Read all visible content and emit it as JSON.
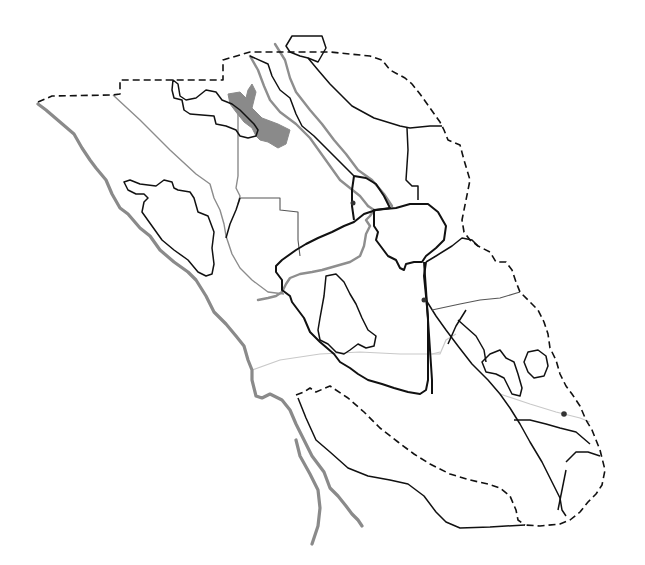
{
  "map": {
    "width": 645,
    "height": 565,
    "background": "#ffffff",
    "labels": [],
    "colors": {
      "coast": "#8a8a8a",
      "river": "#8e8e8e",
      "lake": "#8a8a8a",
      "boundary": "#111111",
      "boundary_secondary": "#555555",
      "road": "#c9c9c9",
      "point": "#333333"
    },
    "layers": {
      "outer_dashed_boundary": "M38,102 L52,96 L113,95 L120,94 L120,80 L223,80 L223,60 L250,52 L330,52 L370,56 L382,60 L390,70 L405,78 L412,84 L420,94 L430,108 L440,122 L444,130 L448,140 L460,145 L464,160 L470,180 L466,200 L462,220 L464,232 L470,240 L478,246 L490,252 L496,262 L506,262 L512,270 L516,282 L520,292 L528,300 L538,310 L544,322 L548,334 L550,348 L556,360 L560,374 L566,386 L572,394 L580,406 L586,420 L592,430 L600,450 L605,470 L602,485 L596,494 L588,502 L580,512 L570,520 L560,524 L540,526 L525,525",
      "coastline": "M38,104 L46,110 L60,122 L74,134 L82,148 L90,160 L96,168 L106,180 L112,194 L120,208 L128,214 L140,228 L150,236 L160,250 L174,262 L188,272 L196,280 L206,296 L214,312 L226,324 L236,336 L244,346 L248,360 L252,370 L252,380 L256,396 L262,398 L270,394 L282,400 L290,410 L296,424 L304,440 L312,456 L324,472 L330,488 L338,496 L346,506 L352,514 L358,520 L362,526",
      "estuary_inner_coast": "M296,440 L300,456 L310,474 L318,490 L320,508 L318,526 L312,544",
      "west_dashed_strip": "M296,395 L304,392 L310,388 L316,392 L330,386 L348,398 L364,412 L380,428 L398,442 L414,454 L430,464 L450,474 L470,480 L488,484 L500,488 L510,496 L516,510 L518,520 L525,525",
      "south_black_curve": "M298,398 L306,418 L316,440 L330,452 L348,468 L368,476 L390,480 L408,484 L424,496 L436,512 L446,522 L460,528 L490,527 L525,525",
      "river_north_main": "M275,44 L285,60 L290,78 L296,92 L310,110 L322,124 L334,140 L346,154 L358,170 L372,180 L384,194 L392,206",
      "river_north_parallel": "M250,56 L258,70 L264,86 L270,100 L280,112 L296,124 L310,138 L320,152 L330,166 L340,180 L350,188 L360,196 L368,206",
      "river_central": "M368,206 L374,210 L370,216 L366,220 L370,226 L366,234 L364,246 L360,256 L350,262 L336,266 L322,270 L312,272 L300,274 L290,278 L286,284 L282,292 L276,296 L268,298 L258,300",
      "lake_polygon": "M228,94 L240,92 L246,98 L248,90 L252,84 L256,92 L252,108 L262,118 L278,124 L290,130 L286,144 L278,148 L268,142 L260,140 L256,136 L252,128 L244,122 L236,112 L230,104 Z",
      "north_hexagon": "M292,36 L322,36 L326,48 L318,62 L308,58 L300,56 L290,52 L286,46 Z",
      "inner_county_northwest": "M173,80 L178,84 L180,96 L186,100 L196,98 L206,90 L216,92 L222,100 L232,104 L240,110 L248,118 L254,124 L258,130 L256,136 L248,138 L240,136 L236,130 L226,126 L216,124 L214,116 L190,114 L184,110 L182,100 L174,98 L172,90 Z",
      "gray_division_west": "M113,95 L140,120 L170,150 L196,174 L210,184 L214,198 L220,210 L224,224 L226,236 L232,254 L240,268 L252,280 L268,292 L284,294",
      "gray_vertical_divider": "M238,112 L238,140 L238,176 L236,188 L240,196 L238,204",
      "gray_block_mid": "M240,198 L280,198 L280,210 L298,212 L298,240 L300,256",
      "black_divider_mid": "M240,198 L236,210 L230,224 L226,238",
      "inner_lobe_west": "M124,182 L130,180 L140,184 L156,186 L164,180 L172,182 L174,188 L178,190 L190,192 L194,198 L198,212 L208,216 L214,232 L212,248 L214,264 L212,274 L206,276 L198,272 L188,260 L174,250 L162,240 L152,226 L142,212 L144,202 L148,198 L144,194 L136,194 L128,190 Z",
      "ne_county_line": "M250,56 L268,64 L272,76 L280,90 L290,98 L296,114 L302,126 L314,136 L326,148 L336,158 L348,170 L354,176",
      "ne_county_line_2": "M308,58 L318,70 L330,84 L342,96 L352,106 L374,118 L400,126 L410,128 L430,126 L442,126",
      "ne_vertical": "M407,128 L408,150 L406,180 L412,186 L418,186 L418,200",
      "bold_central_county": "M354,176 L366,178 L376,184 L384,196 L390,208 L376,210 L364,214 L354,222 L344,226 L332,232 L318,238 L306,244 L296,250 L282,260 L276,266 L276,272 L282,280 L282,290 L290,296 L292,302 L298,310 L304,318 L310,332 L320,342 L334,354 L340,362 L350,368 L358,374 L368,380 L382,384 L394,388 L408,392 L420,394 L426,390 L428,380 L428,360 L428,340 L428,318 L426,296 L424,276 L426,262",
      "bold_central_north_lobe": "M354,176 L352,190 L352,206 L354,220",
      "bold_blob_center": "M374,210 L396,208 L410,204 L428,204 L438,212 L446,226 L444,240 L436,248 L426,256 L422,262 L414,262 L406,264 L404,270 L400,268 L396,260 L388,256 L382,248 L376,240 L378,232 L374,226 Z",
      "inner_lobe_central": "M326,276 L336,274 L344,282 L350,294 L356,304 L362,318 L368,330 L376,336 L374,346 L366,348 L358,344 L350,350 L344,354 L336,352 L328,344 L320,340 L318,330 L320,318 L324,296 Z",
      "east_county_vertical": "M424,262 L426,290 L428,320 L430,350 L432,380 L432,394",
      "east_diagonal_long": "M426,300 L436,316 L446,330 L458,346 L472,364 L488,380 L500,394 L510,408 L520,424 L530,442 L542,462 L552,482 L560,498 L562,510 L566,516",
      "east_divider_1": "M432,310 L460,304 L480,300 L500,298 L520,292",
      "east_divider_2": "M448,344 L456,326 L466,310",
      "east_divider_3": "M458,320 L476,336 L484,350 L486,362",
      "east_inner_lobe_1": "M482,362 L490,354 L500,350 L506,358 L514,362 L518,374 L522,388 L520,396 L512,394 L508,386 L504,378 L496,374 L486,372 Z",
      "east_inner_lobe_2": "M528,352 L538,350 L546,356 L548,366 L544,376 L534,378 L528,372 L524,362 Z",
      "east_hill_county": "M426,262 L436,256 L452,246 L462,238 L472,240 L478,246",
      "south_divider_1": "M514,420 L530,420 L546,424 L560,428 L576,432 L590,444",
      "south_divider_2": "M566,462 L576,452 L588,452 L600,456",
      "south_divider_3": "M558,510 L562,490 L566,470",
      "road_light_horizontal": "M252,370 L280,360 L320,354 L360,352 L400,354 L432,354 L440,352",
      "road_light_east": "M500,394 L530,404 L556,412 L580,418 L590,422",
      "road_light_mid": "M432,354 L440,354 L446,340 L456,334"
    },
    "points": [
      {
        "name": "point-north-central",
        "x": 353,
        "y": 203,
        "r": 2.5
      },
      {
        "name": "point-east-central",
        "x": 424,
        "y": 300,
        "r": 2.5
      },
      {
        "name": "point-southeast",
        "x": 564,
        "y": 414,
        "r": 2.8
      }
    ]
  }
}
